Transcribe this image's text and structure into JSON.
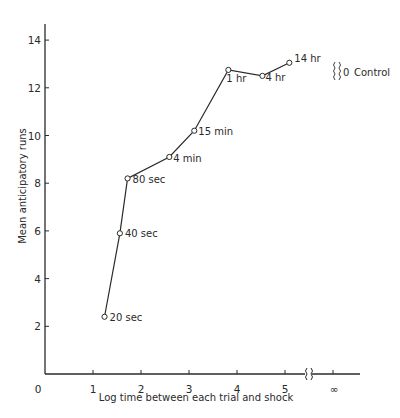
{
  "chart_data": {
    "type": "line",
    "title": "",
    "xlabel": "Log time between each trial and shock",
    "ylabel": "Mean anticipatory runs",
    "xlim": [
      0,
      5.6
    ],
    "ylim": [
      0,
      14.5
    ],
    "grid": false,
    "x_ticks": [
      "0",
      "1",
      "2",
      "3",
      "4",
      "5"
    ],
    "x_extra_tick": "∞",
    "x_axis_break": "{}",
    "y_ticks": [
      "2",
      "4",
      "6",
      "8",
      "10",
      "12",
      "14"
    ],
    "series": [
      {
        "name": "Delay between trial and shock",
        "points": [
          {
            "label": "20 sec",
            "x": 1.24,
            "y": 2.4
          },
          {
            "label": "40 sec",
            "x": 1.56,
            "y": 5.9
          },
          {
            "label": "80 sec",
            "x": 1.72,
            "y": 8.2
          },
          {
            "label": "4 min",
            "x": 2.59,
            "y": 9.1
          },
          {
            "label": "15 min",
            "x": 3.11,
            "y": 10.2
          },
          {
            "label": "1 hr",
            "x": 3.82,
            "y": 12.75
          },
          {
            "label": "4 hr",
            "x": 4.53,
            "y": 12.5
          },
          {
            "label": "14 hr",
            "x": 5.09,
            "y": 13.05
          }
        ]
      }
    ],
    "annotations": [
      {
        "text": "{}0 Control",
        "position": "upper right, beside 14 hr point"
      }
    ],
    "legend": null
  },
  "labels": {
    "control": "Control",
    "control_value": "0",
    "x_zero": "0",
    "infinity": "∞"
  }
}
